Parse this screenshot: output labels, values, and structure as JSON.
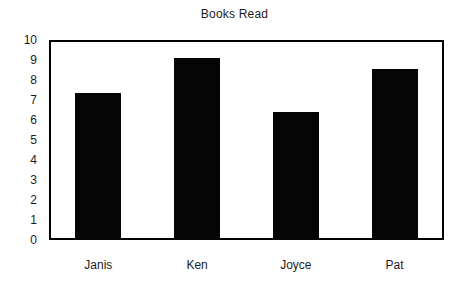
{
  "chart_data": {
    "type": "bar",
    "title": "Books Read",
    "xlabel": "",
    "ylabel": "",
    "categories": [
      "Janis",
      "Ken",
      "Joyce",
      "Pat"
    ],
    "values": [
      7.35,
      9.1,
      6.4,
      8.55
    ],
    "ylim": [
      0,
      10
    ],
    "ytick_labels": [
      "10",
      "9",
      "8",
      "7",
      "6",
      "5",
      "4",
      "3",
      "2",
      "1",
      "0"
    ],
    "ytick_values": [
      10,
      9,
      8,
      7,
      6,
      5,
      4,
      3,
      2,
      1,
      0
    ],
    "grid": false,
    "legend": false,
    "bar_color": "#050505",
    "frame_color": "#000000",
    "background_color": "#ffffff",
    "text_color": "#1c1c1c"
  }
}
